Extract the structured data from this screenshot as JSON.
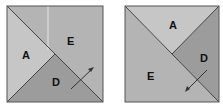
{
  "colors": {
    "light": "#c4c4c4",
    "medium": "#b2b2b2",
    "dark": "#9a9a9a",
    "border": "#555555",
    "text": "#111111"
  },
  "left_square": {
    "pieces": [
      {
        "label": "A",
        "shade": "light"
      },
      {
        "label": "E",
        "shade": "medium"
      },
      {
        "label": "D",
        "shade": "dark"
      }
    ],
    "arrow_direction": "up-right"
  },
  "right_square": {
    "pieces": [
      {
        "label": "A",
        "shade": "light"
      },
      {
        "label": "D",
        "shade": "dark"
      },
      {
        "label": "E",
        "shade": "medium"
      }
    ],
    "arrow_direction": "down-left"
  }
}
